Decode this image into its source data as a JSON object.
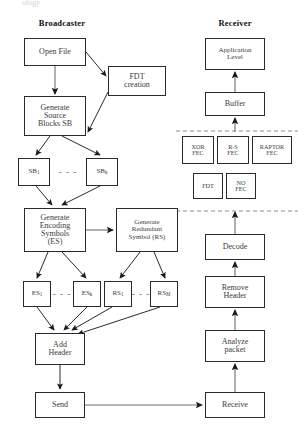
{
  "figure": {
    "cropped_top_text": "ology",
    "columns": [
      {
        "name": "broadcaster-title",
        "label": "Broadcaster",
        "x": 33,
        "y": 18
      },
      {
        "name": "receiver-title",
        "label": "Receiver",
        "x": 212,
        "y": 18
      }
    ]
  },
  "broadcaster": {
    "nodes": [
      {
        "name": "open-file",
        "label": "Open File",
        "x": 24,
        "y": 38,
        "w": 62,
        "h": 28,
        "size": ""
      },
      {
        "name": "fdt-creation",
        "label": "FDT\ncreation",
        "x": 108,
        "y": 66,
        "w": 58,
        "h": 30,
        "size": ""
      },
      {
        "name": "generate-source-blocks",
        "label": "Generate\nSource\nBlocks SB",
        "x": 24,
        "y": 96,
        "w": 62,
        "h": 40,
        "size": ""
      },
      {
        "name": "sb-1",
        "label": "SB",
        "subscript": "1",
        "x": 18,
        "y": 158,
        "w": 32,
        "h": 28,
        "size": "sm"
      },
      {
        "name": "sb-k",
        "label": "SB",
        "subscript": "k",
        "x": 86,
        "y": 158,
        "w": 32,
        "h": 28,
        "size": "sm"
      },
      {
        "name": "generate-encoding-symbols",
        "label": "Generate\nEncoding\nSymbols\n(ES)",
        "x": 24,
        "y": 208,
        "w": 62,
        "h": 44,
        "size": ""
      },
      {
        "name": "generate-redundant-symbol",
        "label": "Generate\nRedundant\nSymbol (RS)",
        "x": 116,
        "y": 208,
        "w": 62,
        "h": 44,
        "size": "sm"
      },
      {
        "name": "es-1",
        "label": "ES",
        "subscript": "1",
        "x": 23,
        "y": 281,
        "w": 28,
        "h": 26,
        "size": "sm"
      },
      {
        "name": "es-k",
        "label": "ES",
        "subscript": "k",
        "x": 73,
        "y": 281,
        "w": 28,
        "h": 26,
        "size": "sm"
      },
      {
        "name": "rs-1",
        "label": "RS",
        "subscript": "1",
        "x": 104,
        "y": 281,
        "w": 28,
        "h": 26,
        "size": "sm"
      },
      {
        "name": "rs-m",
        "label": "RS",
        "subscript": "M",
        "x": 150,
        "y": 281,
        "w": 28,
        "h": 26,
        "size": "sm"
      },
      {
        "name": "add-header",
        "label": "Add\nHeader",
        "x": 35,
        "y": 333,
        "w": 50,
        "h": 32,
        "size": ""
      },
      {
        "name": "send",
        "label": "Send",
        "x": 35,
        "y": 392,
        "w": 50,
        "h": 26,
        "size": ""
      }
    ],
    "ellipses": [
      {
        "name": "sb-ellipsis",
        "label": "- - -",
        "x": 50,
        "y": 158,
        "w": 36,
        "h": 28
      },
      {
        "name": "es-ellipsis",
        "label": "- - -",
        "x": 51,
        "y": 281,
        "w": 22,
        "h": 26
      },
      {
        "name": "rs-ellipsis",
        "label": "- - -",
        "x": 132,
        "y": 281,
        "w": 18,
        "h": 26
      }
    ]
  },
  "receiver": {
    "nodes": [
      {
        "name": "application-level",
        "label": "Application\nLevel",
        "x": 205,
        "y": 38,
        "w": 60,
        "h": 32,
        "size": "sm"
      },
      {
        "name": "buffer",
        "label": "Buffer",
        "x": 205,
        "y": 92,
        "w": 60,
        "h": 24,
        "size": ""
      },
      {
        "name": "xor-fec",
        "label": "XOR\nFEC",
        "x": 182,
        "y": 136,
        "w": 32,
        "h": 28,
        "size": "xs"
      },
      {
        "name": "rs-fec",
        "label": "R-S\nFEC",
        "x": 217,
        "y": 136,
        "w": 32,
        "h": 28,
        "size": "xs"
      },
      {
        "name": "raptor-fec",
        "label": "RAPTOR\nFEC",
        "x": 252,
        "y": 136,
        "w": 40,
        "h": 28,
        "size": "xs"
      },
      {
        "name": "fdt",
        "label": "FDT",
        "x": 193,
        "y": 173,
        "w": 30,
        "h": 26,
        "size": "xs"
      },
      {
        "name": "no-fec",
        "label": "NO\nFEC",
        "x": 226,
        "y": 173,
        "w": 30,
        "h": 26,
        "size": "xs"
      },
      {
        "name": "decode",
        "label": "Decode",
        "x": 205,
        "y": 234,
        "w": 60,
        "h": 26,
        "size": ""
      },
      {
        "name": "remove-header",
        "label": "Remove\nHeader",
        "x": 205,
        "y": 276,
        "w": 60,
        "h": 32,
        "size": ""
      },
      {
        "name": "analyze-packet",
        "label": "Analyze\npacket",
        "x": 205,
        "y": 330,
        "w": 60,
        "h": 32,
        "size": ""
      },
      {
        "name": "receive",
        "label": "Receive",
        "x": 205,
        "y": 392,
        "w": 60,
        "h": 26,
        "size": ""
      }
    ]
  },
  "colors": {
    "stroke": "#2a2a2a",
    "arrow": "#1a1a1a",
    "text": "#3b3b3b",
    "background": "#ffffff",
    "dashed": "#8a8a8a"
  }
}
